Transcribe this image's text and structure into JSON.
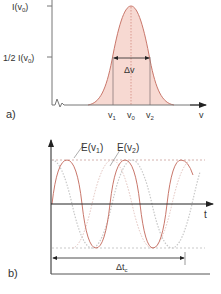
{
  "panel_a": {
    "label": "a)",
    "y_ticks": {
      "peak": "I(v",
      "peak_sub": "0",
      "peak_close": ")",
      "half_prefix": "1/2 I(v",
      "half_sub": "0",
      "half_close": ")"
    },
    "x_labels": {
      "v1": "v",
      "v1_sub": "1",
      "v0": "v",
      "v0_sub": "0",
      "v2": "v",
      "v2_sub": "2",
      "axis": "v"
    },
    "width_label": "Δv"
  },
  "panel_b": {
    "label": "b)",
    "axis_label": "t",
    "curve1": {
      "name": "E(v",
      "sub": "1",
      "close": ")"
    },
    "curve2": {
      "name": "E(v",
      "sub": "2",
      "close": ")"
    },
    "coherence_label": "Δt",
    "coherence_sub": "c"
  },
  "colors": {
    "curve": "#c9776b",
    "fill": "#f7d9d2",
    "axis": "#555555",
    "dotted": "#bbbbbb"
  }
}
